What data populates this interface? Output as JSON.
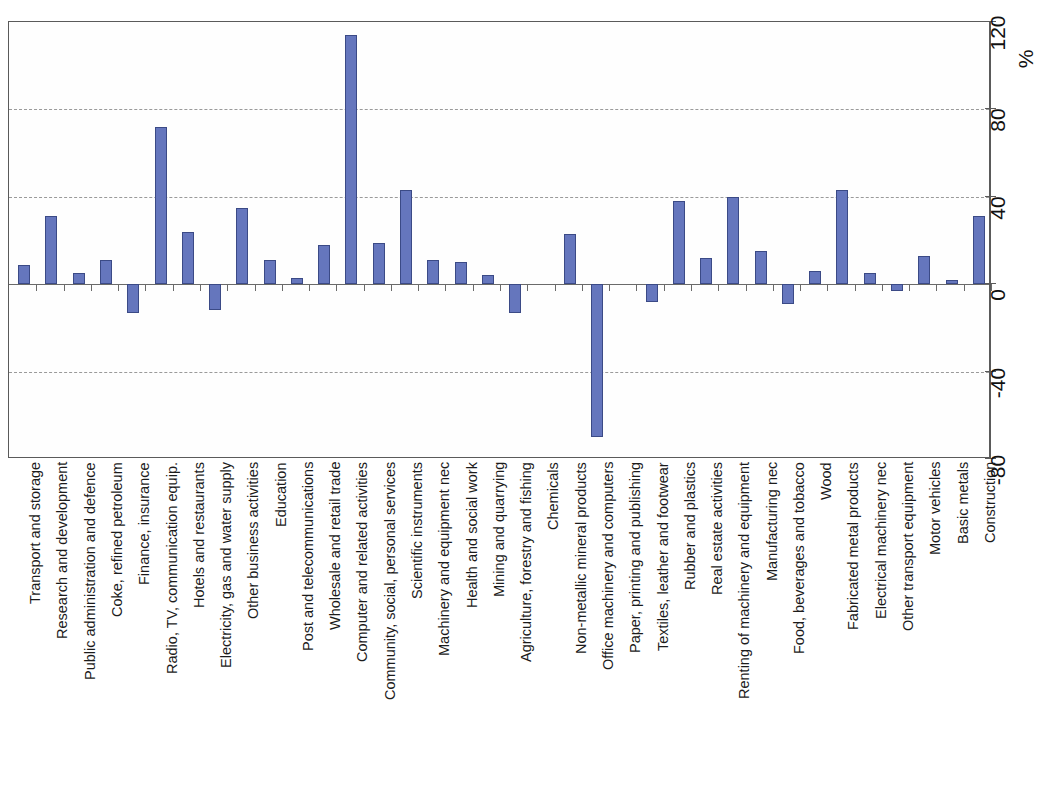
{
  "chart_data": {
    "type": "bar",
    "title": "",
    "subtitle": "",
    "xlabel": "",
    "ylabel": "",
    "unit_label": "%",
    "ylim": [
      -80,
      120
    ],
    "yticks": [
      120,
      80,
      40,
      0,
      -40,
      -80
    ],
    "gridlines": [
      80,
      40,
      -40
    ],
    "grid": true,
    "legend": "none",
    "axis_position": "right",
    "label_rotation": -90,
    "categories": [
      "Transport and storage",
      "Research and development",
      "Public administration and defence",
      "Coke, refined petroleum",
      "Finance, insurance",
      "Radio, TV, communication equip.",
      "Hotels and restaurants",
      "Electricity, gas and water supply",
      "Other business activities",
      "Education",
      "Post and telecommunications",
      "Wholesale and retail trade",
      "Computer and related activities",
      "Community, social, personal services",
      "Scientific instruments",
      "Machinery and equipment nec",
      "Health and social work",
      "Mining and quarrying",
      "Agriculture, forestry and fishing",
      "Chemicals",
      "Non-metallic mineral products",
      "Office machinery and computers",
      "Paper, printing and publishing",
      "Textiles, leather and footwear",
      "Rubber and plastics",
      "Real estate activities",
      "Renting of machinery and equipment",
      "Manufacturing nec",
      "Food, beverages and tobacco",
      "Wood",
      "Fabricated metal products",
      "Electrical machinery nec",
      "Other transport equipment",
      "Motor vehicles",
      "Basic metals",
      "Construction"
    ],
    "values": [
      9,
      31,
      5,
      11,
      -13,
      72,
      24,
      -12,
      35,
      11,
      3,
      18,
      114,
      19,
      43,
      11,
      10,
      4,
      -13,
      0,
      23,
      -70,
      0,
      -8,
      38,
      12,
      40,
      15,
      -9,
      6,
      43,
      5,
      -3,
      13,
      2,
      31
    ],
    "colors": {
      "bar_fill": "#6576bd",
      "bar_border": "#3b4a86",
      "axis": "#5a5a5a",
      "gridline": "#9a9a9a",
      "text": "#1b1b1b",
      "background": "#ffffff"
    }
  }
}
